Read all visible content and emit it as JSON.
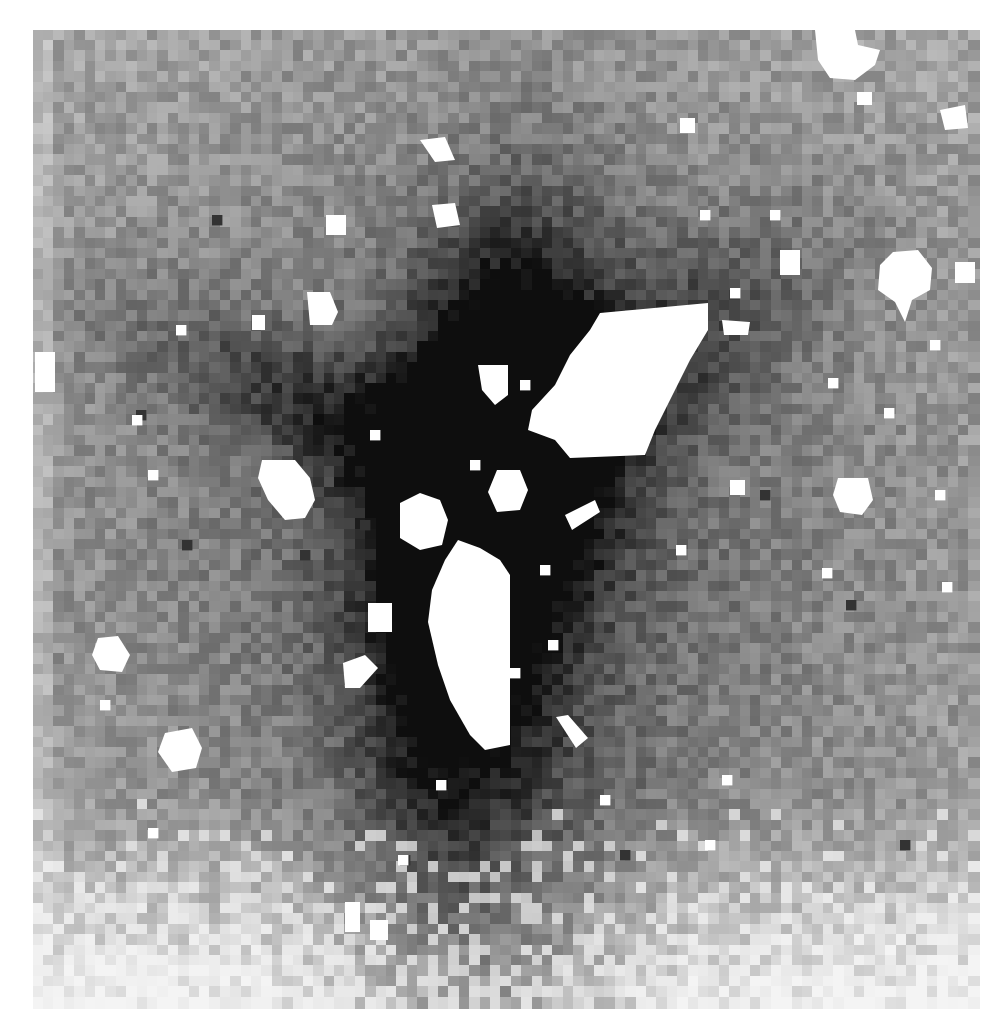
{
  "figure": {
    "caption_partial": "ge by adding to a g",
    "canvas": {
      "width": 1006,
      "height": 1032
    },
    "image_bounds": {
      "x0": 33,
      "y0": 30,
      "x1": 978,
      "y1": 1002
    },
    "pixel_size": 10.4,
    "colors": {
      "background": "#ffffff",
      "mask": "#ffffff",
      "darkest": "#101010",
      "lightest": "#f4f4f4"
    },
    "sky_level": 0.3,
    "noise_amplitude": 0.22,
    "seed": 17,
    "galaxy_components": [
      {
        "cx": 490,
        "cy": 470,
        "sx": 70,
        "sy": 150,
        "angle": 10,
        "amp": 0.75
      },
      {
        "cx": 470,
        "cy": 560,
        "sx": 55,
        "sy": 190,
        "angle": 8,
        "amp": 0.45
      },
      {
        "cx": 360,
        "cy": 430,
        "sx": 170,
        "sy": 45,
        "angle": 25,
        "amp": 0.35
      },
      {
        "cx": 610,
        "cy": 390,
        "sx": 160,
        "sy": 60,
        "angle": -35,
        "amp": 0.35
      },
      {
        "cx": 500,
        "cy": 520,
        "sx": 330,
        "sy": 330,
        "angle": 0,
        "amp": 0.28
      },
      {
        "cx": 500,
        "cy": 780,
        "sx": 90,
        "sy": 160,
        "angle": 0,
        "amp": 0.22
      }
    ],
    "bottom_fade_start": 800,
    "masked_regions": [
      {
        "name": "large-source-upper-right",
        "points": [
          [
            600,
            313
          ],
          [
            708,
            303
          ],
          [
            708,
            330
          ],
          [
            690,
            360
          ],
          [
            670,
            400
          ],
          [
            655,
            430
          ],
          [
            645,
            455
          ],
          [
            570,
            458
          ],
          [
            555,
            440
          ],
          [
            528,
            430
          ],
          [
            532,
            410
          ],
          [
            555,
            385
          ],
          [
            570,
            355
          ],
          [
            590,
            330
          ]
        ]
      },
      {
        "name": "large-source-lower",
        "points": [
          [
            458,
            540
          ],
          [
            480,
            548
          ],
          [
            500,
            560
          ],
          [
            510,
            575
          ],
          [
            510,
            745
          ],
          [
            485,
            750
          ],
          [
            470,
            735
          ],
          [
            450,
            700
          ],
          [
            438,
            665
          ],
          [
            428,
            622
          ],
          [
            432,
            590
          ],
          [
            445,
            560
          ]
        ]
      },
      {
        "name": "source-left-oval",
        "points": [
          [
            262,
            460
          ],
          [
            295,
            460
          ],
          [
            310,
            478
          ],
          [
            315,
            500
          ],
          [
            305,
            518
          ],
          [
            285,
            520
          ],
          [
            268,
            500
          ],
          [
            258,
            478
          ]
        ]
      },
      {
        "name": "source-center-left",
        "points": [
          [
            400,
            503
          ],
          [
            420,
            493
          ],
          [
            440,
            500
          ],
          [
            448,
            520
          ],
          [
            442,
            545
          ],
          [
            420,
            550
          ],
          [
            400,
            538
          ]
        ]
      },
      {
        "name": "source-center-round",
        "points": [
          [
            497,
            470
          ],
          [
            520,
            470
          ],
          [
            528,
            490
          ],
          [
            520,
            510
          ],
          [
            497,
            512
          ],
          [
            488,
            492
          ]
        ]
      },
      {
        "name": "source-upper-center",
        "points": [
          [
            478,
            365
          ],
          [
            508,
            365
          ],
          [
            508,
            395
          ],
          [
            495,
            405
          ],
          [
            482,
            390
          ]
        ]
      },
      {
        "name": "source-right-star",
        "points": [
          [
            893,
            252
          ],
          [
            918,
            250
          ],
          [
            932,
            268
          ],
          [
            930,
            290
          ],
          [
            912,
            300
          ],
          [
            905,
            322
          ],
          [
            895,
            302
          ],
          [
            878,
            290
          ],
          [
            880,
            265
          ]
        ]
      },
      {
        "name": "source-right-mid",
        "points": [
          [
            838,
            478
          ],
          [
            868,
            478
          ],
          [
            873,
            500
          ],
          [
            862,
            515
          ],
          [
            840,
            512
          ],
          [
            833,
            495
          ]
        ]
      },
      {
        "name": "source-top-right",
        "points": [
          [
            815,
            30
          ],
          [
            855,
            30
          ],
          [
            858,
            45
          ],
          [
            880,
            50
          ],
          [
            875,
            65
          ],
          [
            855,
            80
          ],
          [
            830,
            78
          ],
          [
            818,
            60
          ]
        ]
      },
      {
        "name": "source-left-low",
        "points": [
          [
            98,
            638
          ],
          [
            118,
            636
          ],
          [
            130,
            655
          ],
          [
            122,
            672
          ],
          [
            100,
            670
          ],
          [
            92,
            655
          ]
        ]
      },
      {
        "name": "source-lower-left",
        "points": [
          [
            165,
            733
          ],
          [
            192,
            728
          ],
          [
            202,
            748
          ],
          [
            196,
            768
          ],
          [
            172,
            772
          ],
          [
            158,
            752
          ]
        ]
      },
      {
        "name": "source-upper-left",
        "points": [
          [
            307,
            292
          ],
          [
            330,
            292
          ],
          [
            338,
            312
          ],
          [
            332,
            325
          ],
          [
            310,
            325
          ]
        ]
      },
      {
        "name": "source-top-center",
        "points": [
          [
            432,
            205
          ],
          [
            455,
            203
          ],
          [
            460,
            225
          ],
          [
            437,
            228
          ]
        ]
      },
      {
        "name": "source-small-1",
        "points": [
          [
            368,
            603
          ],
          [
            392,
            603
          ],
          [
            392,
            632
          ],
          [
            368,
            632
          ]
        ]
      },
      {
        "name": "source-small-2",
        "points": [
          [
            343,
            663
          ],
          [
            365,
            655
          ],
          [
            378,
            668
          ],
          [
            360,
            688
          ],
          [
            345,
            688
          ]
        ]
      },
      {
        "name": "source-small-3",
        "points": [
          [
            556,
            717
          ],
          [
            568,
            715
          ],
          [
            588,
            738
          ],
          [
            576,
            748
          ]
        ]
      },
      {
        "name": "source-small-4",
        "points": [
          [
            565,
            515
          ],
          [
            595,
            500
          ],
          [
            600,
            512
          ],
          [
            572,
            530
          ]
        ]
      },
      {
        "name": "source-small-5",
        "points": [
          [
            420,
            140
          ],
          [
            445,
            137
          ],
          [
            455,
            160
          ],
          [
            435,
            162
          ]
        ]
      },
      {
        "name": "source-small-6",
        "points": [
          [
            940,
            110
          ],
          [
            965,
            105
          ],
          [
            968,
            128
          ],
          [
            945,
            130
          ]
        ]
      },
      {
        "name": "source-small-7",
        "points": [
          [
            955,
            262
          ],
          [
            975,
            262
          ],
          [
            975,
            283
          ],
          [
            955,
            283
          ]
        ]
      },
      {
        "name": "source-small-8",
        "points": [
          [
            35,
            352
          ],
          [
            55,
            352
          ],
          [
            55,
            392
          ],
          [
            35,
            392
          ]
        ]
      },
      {
        "name": "source-small-9",
        "points": [
          [
            780,
            250
          ],
          [
            800,
            250
          ],
          [
            800,
            275
          ],
          [
            780,
            275
          ]
        ]
      },
      {
        "name": "source-small-10",
        "points": [
          [
            722,
            320
          ],
          [
            750,
            322
          ],
          [
            748,
            335
          ],
          [
            724,
            335
          ]
        ]
      },
      {
        "name": "source-small-11",
        "points": [
          [
            326,
            215
          ],
          [
            346,
            215
          ],
          [
            346,
            235
          ],
          [
            326,
            235
          ]
        ]
      },
      {
        "name": "source-small-12",
        "points": [
          [
            345,
            902
          ],
          [
            360,
            902
          ],
          [
            360,
            932
          ],
          [
            345,
            932
          ]
        ]
      },
      {
        "name": "source-small-13",
        "points": [
          [
            370,
            920
          ],
          [
            388,
            920
          ],
          [
            388,
            940
          ],
          [
            370,
            940
          ]
        ]
      },
      {
        "name": "source-small-14",
        "points": [
          [
            857,
            92
          ],
          [
            872,
            92
          ],
          [
            872,
            105
          ],
          [
            857,
            105
          ]
        ]
      },
      {
        "name": "source-small-15",
        "points": [
          [
            680,
            118
          ],
          [
            695,
            118
          ],
          [
            695,
            133
          ],
          [
            680,
            133
          ]
        ]
      },
      {
        "name": "source-small-16",
        "points": [
          [
            252,
            315
          ],
          [
            265,
            315
          ],
          [
            265,
            330
          ],
          [
            252,
            330
          ]
        ]
      },
      {
        "name": "source-small-17",
        "points": [
          [
            730,
            480
          ],
          [
            745,
            480
          ],
          [
            745,
            495
          ],
          [
            730,
            495
          ]
        ]
      }
    ],
    "small_masked_pixels": [
      [
        176,
        325
      ],
      [
        370,
        430
      ],
      [
        470,
        460
      ],
      [
        540,
        565
      ],
      [
        510,
        668
      ],
      [
        548,
        640
      ],
      [
        700,
        210
      ],
      [
        770,
        210
      ],
      [
        930,
        340
      ],
      [
        828,
        378
      ],
      [
        132,
        415
      ],
      [
        148,
        470
      ],
      [
        884,
        408
      ],
      [
        676,
        545
      ],
      [
        822,
        568
      ],
      [
        942,
        582
      ],
      [
        600,
        795
      ],
      [
        436,
        780
      ],
      [
        148,
        828
      ],
      [
        398,
        855
      ],
      [
        722,
        775
      ],
      [
        705,
        840
      ],
      [
        935,
        490
      ],
      [
        520,
        380
      ],
      [
        730,
        288
      ],
      [
        100,
        700
      ]
    ],
    "dark_pixels": [
      [
        846,
        600
      ],
      [
        400,
        855
      ],
      [
        360,
        520
      ],
      [
        212,
        215
      ],
      [
        136,
        410
      ],
      [
        182,
        540
      ],
      [
        300,
        550
      ],
      [
        620,
        850
      ],
      [
        900,
        840
      ],
      [
        760,
        490
      ]
    ]
  }
}
